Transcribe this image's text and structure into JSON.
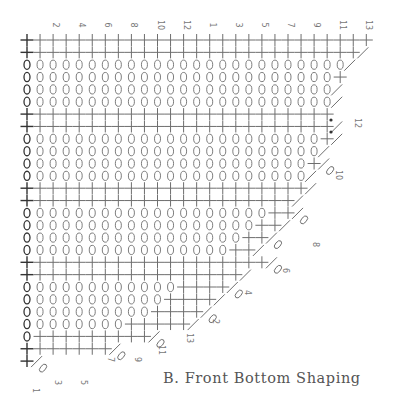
{
  "title": "B. Front Bottom Shaping",
  "colors": {
    "ink": "#6e6e6e",
    "ink_dark": "#333333",
    "label": "#808080",
    "caption": "#555555"
  },
  "symbols": {
    "sc": "+ (single crochet)",
    "ch": "0 (chain)",
    "dec": "diagonal (decrease)",
    "dot": "• (marker)"
  },
  "grid": {
    "col_x0": 27,
    "col_dx": 13.05,
    "row_y0": 40,
    "row_dy": 12.35,
    "columns": 27
  },
  "top_labels": [
    {
      "text": "2",
      "col": 2
    },
    {
      "text": "4",
      "col": 4
    },
    {
      "text": "6",
      "col": 6
    },
    {
      "text": "8",
      "col": 8
    },
    {
      "text": "10",
      "col": 10
    },
    {
      "text": "12",
      "col": 12
    },
    {
      "text": "1",
      "col": 14
    },
    {
      "text": "3",
      "col": 16
    },
    {
      "text": "5",
      "col": 18
    },
    {
      "text": "7",
      "col": 20
    },
    {
      "text": "9",
      "col": 22
    },
    {
      "text": "11",
      "col": 24
    },
    {
      "text": "13",
      "col": 26
    }
  ],
  "rows": [
    {
      "type": "sc",
      "len": 27,
      "end": "none"
    },
    {
      "type": "sc",
      "len": 26,
      "end": "dec"
    },
    {
      "type": "ch",
      "len": 25,
      "end": "dec"
    },
    {
      "type": "ch",
      "len": 24,
      "end": "sc"
    },
    {
      "type": "ch",
      "len": 24,
      "end": "dec"
    },
    {
      "type": "ch",
      "len": 24,
      "end": "dec"
    },
    {
      "type": "sc",
      "len": 24,
      "end": "dot"
    },
    {
      "type": "sc",
      "len": 24,
      "end": "dec_dot"
    },
    {
      "type": "ch",
      "len": 23,
      "end": "sc_dec"
    },
    {
      "type": "ch",
      "len": 23,
      "end": "dec"
    },
    {
      "type": "ch",
      "len": 22,
      "end": "sc_dec_o"
    },
    {
      "type": "ch",
      "len": 22,
      "end": "dec"
    },
    {
      "type": "sc",
      "len": 22,
      "end": "dec"
    },
    {
      "type": "sc",
      "len": 21,
      "end": "dec"
    },
    {
      "type": "ch",
      "len": 19,
      "end": "sc2_dec_o"
    },
    {
      "type": "ch",
      "len": 18,
      "end": "sc2_dec"
    },
    {
      "type": "ch",
      "len": 17,
      "end": "sc2_dec_o"
    },
    {
      "type": "ch",
      "len": 16,
      "end": "sc2_dec"
    },
    {
      "type": "sc",
      "len": 19,
      "end": "dec_o"
    },
    {
      "type": "sc",
      "len": 17,
      "end": "dec"
    },
    {
      "type": "ch",
      "len": 12,
      "end": "sc4_dec_o"
    },
    {
      "type": "ch",
      "len": 11,
      "end": "sc4_dec"
    },
    {
      "type": "ch",
      "len": 10,
      "end": "sc4_dec_o"
    },
    {
      "type": "ch",
      "len": 8,
      "end": "sc5_dec"
    },
    {
      "type": "ch",
      "len": 1,
      "end": "sc9_dec_o"
    },
    {
      "type": "sc",
      "len": 7,
      "end": "dec_o"
    },
    {
      "type": "sc",
      "len": 1,
      "end": "dec_o"
    }
  ],
  "edge_labels": [
    {
      "text": "12",
      "x": 355,
      "y": 118
    },
    {
      "text": "10",
      "x": 336,
      "y": 170
    },
    {
      "text": "8",
      "x": 313,
      "y": 242
    },
    {
      "text": "6",
      "x": 283,
      "y": 268
    },
    {
      "text": "4",
      "x": 245,
      "y": 290
    },
    {
      "text": "2",
      "x": 213,
      "y": 319
    },
    {
      "text": "13",
      "x": 187,
      "y": 333
    },
    {
      "text": "11",
      "x": 159,
      "y": 345
    },
    {
      "text": "9",
      "x": 135,
      "y": 357
    },
    {
      "text": "7",
      "x": 108,
      "y": 357
    },
    {
      "text": "5",
      "x": 81,
      "y": 380
    },
    {
      "text": "3",
      "x": 55,
      "y": 380
    },
    {
      "text": "1",
      "x": 33,
      "y": 388
    }
  ],
  "dots": [
    {
      "x": 331,
      "y": 120
    },
    {
      "x": 331,
      "y": 132
    }
  ]
}
